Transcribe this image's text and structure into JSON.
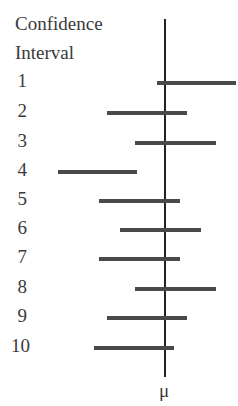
{
  "header": {
    "line1": "Confidence",
    "line2": "Interval"
  },
  "axis_label": "μ",
  "chart_data": {
    "type": "interval",
    "xlabel": "μ",
    "reference_line": "μ (true mean)",
    "categories": [
      "1",
      "2",
      "3",
      "4",
      "5",
      "6",
      "7",
      "8",
      "9",
      "10"
    ],
    "intervals_px": [
      {
        "label": "1",
        "lo": 157,
        "hi": 236
      },
      {
        "label": "2",
        "lo": 107,
        "hi": 187
      },
      {
        "label": "3",
        "lo": 135,
        "hi": 216
      },
      {
        "label": "4",
        "lo": 58,
        "hi": 137
      },
      {
        "label": "5",
        "lo": 99,
        "hi": 180
      },
      {
        "label": "6",
        "lo": 120,
        "hi": 201
      },
      {
        "label": "7",
        "lo": 99,
        "hi": 180
      },
      {
        "label": "8",
        "lo": 135,
        "hi": 216
      },
      {
        "label": "9",
        "lo": 107,
        "hi": 187
      },
      {
        "label": "10",
        "lo": 94,
        "hi": 174
      }
    ],
    "mu_px": 165,
    "contains_mu": [
      false,
      true,
      true,
      false,
      true,
      true,
      true,
      true,
      true,
      true
    ],
    "grid": false,
    "legend": "none"
  },
  "rows": [
    {
      "label": "1",
      "y": 83,
      "lo": 157,
      "hi": 236
    },
    {
      "label": "2",
      "y": 113,
      "lo": 107,
      "hi": 187
    },
    {
      "label": "3",
      "y": 143,
      "lo": 135,
      "hi": 216
    },
    {
      "label": "4",
      "y": 172,
      "lo": 58,
      "hi": 137
    },
    {
      "label": "5",
      "y": 201,
      "lo": 99,
      "hi": 180
    },
    {
      "label": "6",
      "y": 230,
      "lo": 120,
      "hi": 201
    },
    {
      "label": "7",
      "y": 259,
      "lo": 99,
      "hi": 180
    },
    {
      "label": "8",
      "y": 289,
      "lo": 135,
      "hi": 216
    },
    {
      "label": "9",
      "y": 318,
      "lo": 107,
      "hi": 187
    },
    {
      "label": "10",
      "y": 348,
      "lo": 94,
      "hi": 174
    }
  ]
}
